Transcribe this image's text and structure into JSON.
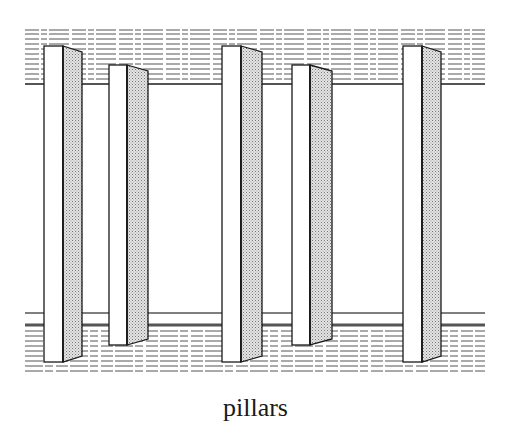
{
  "figure": {
    "caption": "pillars",
    "colors": {
      "ink": "#1a1a1a",
      "background": "#ffffff",
      "hatch_fill": "#c8c8c8",
      "band_line": "#555555"
    },
    "upper_band": {
      "x_start": 25,
      "x_end": 485,
      "line_ys": [
        30,
        34,
        39,
        44,
        49,
        54,
        59,
        64,
        69,
        74,
        79
      ],
      "edge_line_y": 84
    },
    "lower_band": {
      "x_start": 25,
      "x_end": 485,
      "edge_line_ys": [
        313,
        325
      ],
      "line_ys": [
        331,
        336,
        341,
        346,
        351,
        356,
        361,
        366,
        371
      ]
    },
    "pillars": [
      {
        "id": 1,
        "label": "tall",
        "front_x": 44,
        "face_w": 19,
        "side_w": 19,
        "top_y": 46,
        "bottom_y": 362,
        "slope": 6
      },
      {
        "id": 2,
        "label": "short",
        "front_x": 109,
        "face_w": 18,
        "side_w": 21,
        "top_y": 65,
        "bottom_y": 345,
        "slope": 6
      },
      {
        "id": 3,
        "label": "tall",
        "front_x": 222,
        "face_w": 19,
        "side_w": 21,
        "top_y": 46,
        "bottom_y": 362,
        "slope": 6
      },
      {
        "id": 4,
        "label": "short",
        "front_x": 292,
        "face_w": 18,
        "side_w": 22,
        "top_y": 65,
        "bottom_y": 345,
        "slope": 6
      },
      {
        "id": 5,
        "label": "tall",
        "front_x": 403,
        "face_w": 19,
        "side_w": 19,
        "top_y": 46,
        "bottom_y": 362,
        "slope": 6
      }
    ]
  }
}
